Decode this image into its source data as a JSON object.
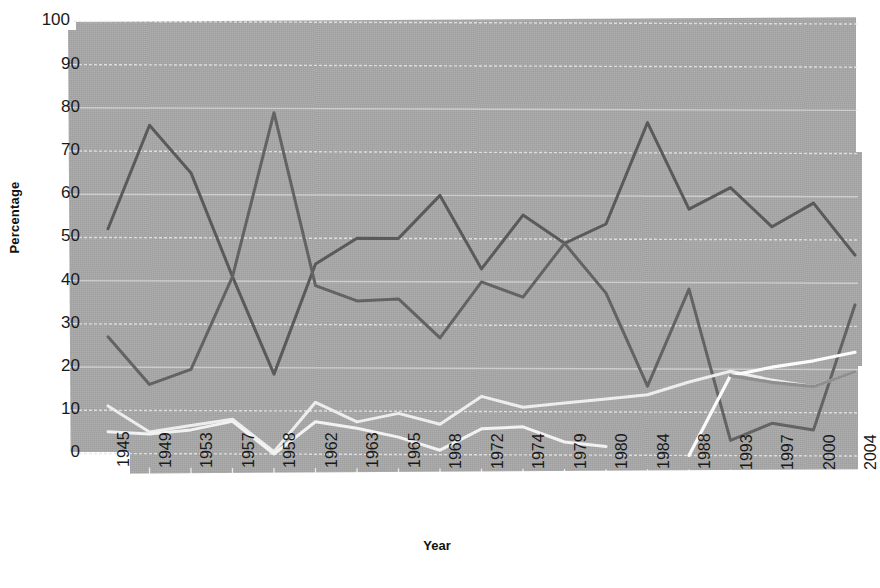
{
  "chart_data": {
    "type": "line",
    "title": "",
    "xlabel": "Year",
    "ylabel": "Percentage",
    "ylim": [
      0,
      100
    ],
    "ytick_step": 10,
    "grid": true,
    "legend": "none",
    "categories": [
      "1945",
      "1949",
      "1953",
      "1957",
      "1958",
      "1962",
      "1963",
      "1965",
      "1968",
      "1972",
      "1974",
      "1979",
      "1980",
      "1984",
      "1988",
      "1993",
      "1997",
      "2000",
      "2004"
    ],
    "yticks": [
      "0",
      "10",
      "20",
      "30",
      "40",
      "50",
      "60",
      "70",
      "80",
      "90",
      "100"
    ],
    "series": [
      {
        "name": "series-dark-a",
        "color": "#5a5a5a",
        "width": 3.0,
        "values": [
          52,
          76,
          65,
          41,
          18.5,
          44,
          50,
          50,
          60,
          43,
          55.5,
          49,
          53.5,
          77,
          57,
          62,
          53,
          58.5,
          46.5
        ]
      },
      {
        "name": "series-dark-b",
        "color": "#636363",
        "width": 3.0,
        "values": [
          27,
          16,
          19.5,
          41,
          79,
          39,
          35.5,
          36,
          27,
          40,
          36.5,
          49,
          37.5,
          16,
          38.5,
          3.5,
          7.5,
          6,
          35
        ]
      },
      {
        "name": "series-light-a",
        "color": "#ededed",
        "width": 3.0,
        "values": [
          11,
          5,
          6.5,
          8,
          0.5,
          12,
          7.5,
          9.5,
          7,
          13.5,
          11,
          12,
          13,
          14,
          17,
          19.5,
          17.5,
          16,
          19.5
        ]
      },
      {
        "name": "series-light-b",
        "color": "#f2f2f2",
        "width": 3.0,
        "values": [
          5,
          4.5,
          5.5,
          7.5,
          0,
          7.5,
          6,
          4,
          1,
          6,
          6.5,
          3,
          2,
          null,
          null,
          null,
          null,
          null,
          null
        ]
      },
      {
        "name": "series-white-rising",
        "color": "#fbfbfb",
        "width": 3.2,
        "values": [
          null,
          null,
          null,
          null,
          null,
          null,
          null,
          null,
          null,
          null,
          null,
          null,
          null,
          null,
          0,
          18.5,
          20.5,
          22,
          24
        ]
      },
      {
        "name": "series-gray-low",
        "color": "#8f8f8f",
        "width": 3.2,
        "values": [
          null,
          null,
          null,
          null,
          null,
          null,
          null,
          null,
          null,
          null,
          null,
          null,
          null,
          null,
          null,
          18.5,
          17,
          16,
          19.5
        ]
      }
    ]
  },
  "axes": {
    "y_title": "Percentage",
    "x_title": "Year"
  }
}
